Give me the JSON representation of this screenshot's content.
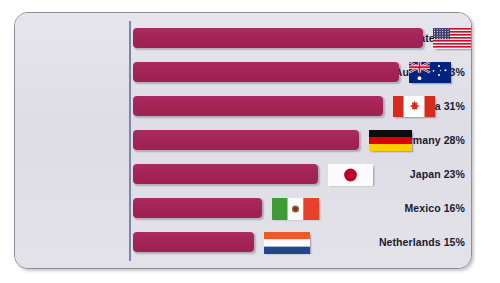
{
  "chart_data": {
    "type": "bar",
    "orientation": "horizontal",
    "title": "",
    "subtitle": "",
    "xlabel": "",
    "ylabel": "",
    "xlim": [
      0,
      40
    ],
    "grid": false,
    "legend": null,
    "value_suffix": "%",
    "categories": [
      "United States",
      "Australia",
      "Canada",
      "Germany",
      "Japan",
      "Mexico",
      "Netherlands"
    ],
    "values": [
      36,
      33,
      31,
      28,
      23,
      16,
      15
    ],
    "tick_labels": [
      "United States 36%",
      "Australia 33%",
      "Canada 31%",
      "Germany 28%",
      "Japan 23%",
      "Mexico 16%",
      "Netherlands 15%"
    ],
    "annotations": [
      {
        "category": "United States",
        "icon": "flag-united-states"
      },
      {
        "category": "Australia",
        "icon": "flag-australia"
      },
      {
        "category": "Canada",
        "icon": "flag-canada"
      },
      {
        "category": "Germany",
        "icon": "flag-germany"
      },
      {
        "category": "Japan",
        "icon": "flag-japan"
      },
      {
        "category": "Mexico",
        "icon": "flag-mexico"
      },
      {
        "category": "Netherlands",
        "icon": "flag-netherlands"
      }
    ],
    "colors": {
      "bar": "#a32355",
      "panel_background": "#e2e1e8",
      "panel_border": "#8d8d9c",
      "axis_line": "#7d85b4",
      "label_text": "#191a2e",
      "page_background": "#ffffff"
    }
  },
  "rows": [
    {
      "label": "United States 36%",
      "country": "United States",
      "value": 36,
      "flag": "flag-united-states"
    },
    {
      "label": "Australia 33%",
      "country": "Australia",
      "value": 33,
      "flag": "flag-australia"
    },
    {
      "label": "Canada 31%",
      "country": "Canada",
      "value": 31,
      "flag": "flag-canada"
    },
    {
      "label": "Germany 28%",
      "country": "Germany",
      "value": 28,
      "flag": "flag-germany"
    },
    {
      "label": "Japan 23%",
      "country": "Japan",
      "value": 23,
      "flag": "flag-japan"
    },
    {
      "label": "Mexico 16%",
      "country": "Mexico",
      "value": 16,
      "flag": "flag-mexico"
    },
    {
      "label": "Netherlands 15%",
      "country": "Netherlands",
      "value": 15,
      "flag": "flag-netherlands"
    }
  ]
}
